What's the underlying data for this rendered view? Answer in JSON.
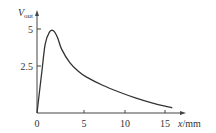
{
  "chart_data": {
    "type": "line",
    "title": "",
    "xlabel": "x/mm",
    "ylabel": "V_out",
    "ylabel_main": "V",
    "ylabel_sub": "out",
    "xlabel_var": "x",
    "xlabel_unit": "/mm",
    "x_ticks": [
      "0",
      "5",
      "10",
      "15"
    ],
    "y_ticks": [
      "2.5",
      "5"
    ],
    "xlim": [
      0,
      17.5
    ],
    "ylim": [
      0,
      6
    ],
    "grid": false,
    "legend": null,
    "series": [
      {
        "name": "V_out",
        "x": [
          0,
          0.6,
          1.0,
          1.5,
          2.0,
          2.5,
          3.0,
          4.0,
          5.0,
          6.0,
          8.0,
          10.0,
          12.0,
          14.0,
          16.5
        ],
        "values": [
          0,
          2.5,
          4.1,
          4.8,
          4.9,
          4.5,
          3.8,
          3.0,
          2.5,
          2.15,
          1.65,
          1.25,
          0.9,
          0.6,
          0.3
        ]
      }
    ]
  }
}
